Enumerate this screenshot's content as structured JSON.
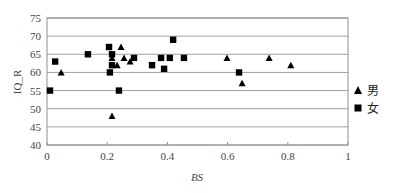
{
  "chart_data": {
    "type": "scatter",
    "title": "",
    "xlabel": "BS",
    "ylabel": "IQ_R",
    "xlim": [
      0,
      1
    ],
    "ylim": [
      40,
      75
    ],
    "x_ticks": [
      "0",
      "0.2",
      "0.4",
      "0.6",
      "0.8",
      "1"
    ],
    "y_ticks": [
      "40",
      "45",
      "50",
      "55",
      "60",
      "65",
      "70",
      "75"
    ],
    "grid": "horizontal",
    "legend_position": "right",
    "series": [
      {
        "name": "男",
        "marker": "triangle",
        "points": [
          [
            0.047,
            60
          ],
          [
            0.216,
            64
          ],
          [
            0.216,
            48
          ],
          [
            0.233,
            62
          ],
          [
            0.246,
            67
          ],
          [
            0.256,
            64
          ],
          [
            0.276,
            63
          ],
          [
            0.598,
            64
          ],
          [
            0.648,
            57
          ],
          [
            0.738,
            64
          ],
          [
            0.81,
            62
          ]
        ]
      },
      {
        "name": "女",
        "marker": "square",
        "points": [
          [
            0.01,
            55
          ],
          [
            0.027,
            63
          ],
          [
            0.136,
            65
          ],
          [
            0.206,
            67
          ],
          [
            0.209,
            60
          ],
          [
            0.216,
            65
          ],
          [
            0.216,
            62
          ],
          [
            0.239,
            55
          ],
          [
            0.289,
            64
          ],
          [
            0.349,
            62
          ],
          [
            0.379,
            64
          ],
          [
            0.389,
            61
          ],
          [
            0.408,
            64
          ],
          [
            0.419,
            69
          ],
          [
            0.455,
            64
          ],
          [
            0.638,
            60
          ]
        ]
      }
    ]
  },
  "legend": {
    "items": [
      {
        "label": "男",
        "icon": "triangle-marker-icon"
      },
      {
        "label": "女",
        "icon": "square-marker-icon"
      }
    ]
  },
  "colors": {
    "marker": "#000000",
    "grid": "#a0a0a0",
    "axis": "#909090",
    "text": "#444444"
  }
}
